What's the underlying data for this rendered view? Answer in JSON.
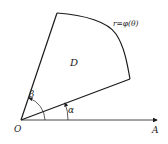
{
  "diagram": {
    "region_label": "D",
    "curve_label": "r=φ(θ)",
    "origin_label": "O",
    "axis_label": "A",
    "angle_alpha_label": "α",
    "angle_beta_label": "β",
    "stroke_color": "#1a1a1a"
  }
}
